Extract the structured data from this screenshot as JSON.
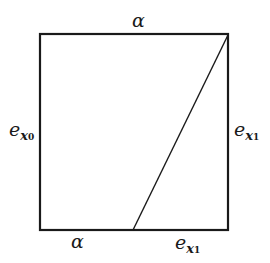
{
  "diagram": {
    "square": {
      "x": 40,
      "y": 34,
      "width": 188,
      "height": 196,
      "stroke": "#1a1a1a"
    },
    "diagonal": {
      "x1": 133,
      "y1": 230,
      "x2": 228,
      "y2": 35
    },
    "labels": {
      "top": {
        "base": "α"
      },
      "left": {
        "base": "e",
        "sub": "x",
        "subsub": "0"
      },
      "right": {
        "base": "e",
        "sub": "x",
        "subsub": "1"
      },
      "bottom_left": {
        "base": "α"
      },
      "bottom_right": {
        "base": "e",
        "sub": "x",
        "subsub": "1"
      }
    }
  }
}
